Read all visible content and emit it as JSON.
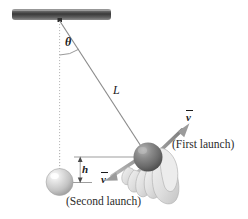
{
  "figure": {
    "type": "physics-diagram",
    "background_color": "#ffffff"
  },
  "labels": {
    "angle": "θ",
    "length": "L",
    "height": "h",
    "velocity_first": "v",
    "velocity_second": "v",
    "caption_first": "(First launch)",
    "caption_second": "(Second launch)"
  },
  "colors": {
    "ink": "#1a1a1a",
    "line": "#7a7a7a",
    "dotted": "#b0b0b0",
    "bar_dark": "#3b3b3b",
    "bar_light": "#8e8e8e",
    "ball_light": "#c9c9c9",
    "ball_dark": "#6f6f6f",
    "hand": "#e3e3e3",
    "arrow": "#8a8a8a"
  },
  "elements": {
    "ceiling_bar": "ceiling-support-bar",
    "pivot": "pivot-point",
    "dotted_vertical": "vertical-reference-line",
    "angle_arc": "theta-angle-arc",
    "string": "pendulum-string",
    "resting_ball": "resting-pendulum-bob",
    "held_ball": "held-pendulum-bob",
    "hand": "hand-holding-ball",
    "arrow_first": "first-launch-velocity-arrow",
    "arrow_second": "second-launch-velocity-arrow",
    "height_dimension": "height-dimension-h"
  }
}
